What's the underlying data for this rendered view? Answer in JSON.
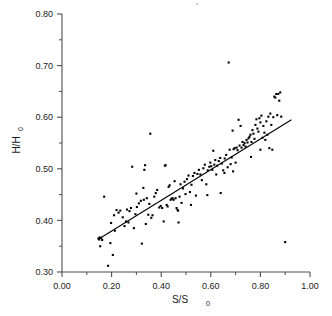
{
  "chart_data": {
    "type": "scatter",
    "title": "",
    "xlabel": "S/S0",
    "xlabel_base": "S/S",
    "xlabel_sub": "0",
    "ylabel": "H/H0",
    "ylabel_base": "H/H",
    "ylabel_sub": "0",
    "xlim": [
      0.0,
      1.0
    ],
    "ylim": [
      0.3,
      0.8
    ],
    "xticks": [
      0.0,
      0.2,
      0.4,
      0.6,
      0.8,
      1.0
    ],
    "xtick_labels": [
      "0.00",
      "0.20",
      "0.40",
      "0.60",
      "0.80",
      "1.00"
    ],
    "xticks_minor": [
      0.1,
      0.3,
      0.5,
      0.7,
      0.9
    ],
    "yticks": [
      0.3,
      0.4,
      0.5,
      0.6,
      0.7,
      0.8
    ],
    "ytick_labels": [
      "0.30",
      "0.40",
      "0.50",
      "0.60",
      "0.70",
      "0.80"
    ],
    "yticks_minor": [
      0.35,
      0.45,
      0.55,
      0.65,
      0.75
    ],
    "grid": false,
    "legend": null,
    "marker": "square",
    "marker_size_px": 2.1,
    "marker_color": "#000000",
    "series": [
      {
        "name": "observations",
        "points": [
          [
            0.147,
            0.365
          ],
          [
            0.15,
            0.363
          ],
          [
            0.152,
            0.367
          ],
          [
            0.154,
            0.35
          ],
          [
            0.158,
            0.366
          ],
          [
            0.162,
            0.362
          ],
          [
            0.17,
            0.446
          ],
          [
            0.186,
            0.312
          ],
          [
            0.195,
            0.356
          ],
          [
            0.198,
            0.395
          ],
          [
            0.205,
            0.333
          ],
          [
            0.21,
            0.41
          ],
          [
            0.213,
            0.38
          ],
          [
            0.22,
            0.42
          ],
          [
            0.228,
            0.415
          ],
          [
            0.235,
            0.419
          ],
          [
            0.245,
            0.406
          ],
          [
            0.252,
            0.389
          ],
          [
            0.258,
            0.398
          ],
          [
            0.262,
            0.421
          ],
          [
            0.268,
            0.396
          ],
          [
            0.272,
            0.418
          ],
          [
            0.278,
            0.424
          ],
          [
            0.283,
            0.504
          ],
          [
            0.29,
            0.385
          ],
          [
            0.296,
            0.412
          ],
          [
            0.302,
            0.426
          ],
          [
            0.31,
            0.433
          ],
          [
            0.318,
            0.438
          ],
          [
            0.322,
            0.355
          ],
          [
            0.328,
            0.463
          ],
          [
            0.332,
            0.498
          ],
          [
            0.335,
            0.507
          ],
          [
            0.338,
            0.393
          ],
          [
            0.342,
            0.443
          ],
          [
            0.348,
            0.411
          ],
          [
            0.352,
            0.432
          ],
          [
            0.356,
            0.568
          ],
          [
            0.36,
            0.405
          ],
          [
            0.365,
            0.41
          ],
          [
            0.372,
            0.446
          ],
          [
            0.378,
            0.453
          ],
          [
            0.384,
            0.459
          ],
          [
            0.392,
            0.425
          ],
          [
            0.398,
            0.428
          ],
          [
            0.404,
            0.424
          ],
          [
            0.41,
            0.398
          ],
          [
            0.415,
            0.506
          ],
          [
            0.418,
            0.507
          ],
          [
            0.422,
            0.43
          ],
          [
            0.426,
            0.427
          ],
          [
            0.43,
            0.465
          ],
          [
            0.434,
            0.468
          ],
          [
            0.438,
            0.44
          ],
          [
            0.442,
            0.442
          ],
          [
            0.446,
            0.443
          ],
          [
            0.45,
            0.44
          ],
          [
            0.454,
            0.476
          ],
          [
            0.458,
            0.443
          ],
          [
            0.462,
            0.424
          ],
          [
            0.466,
            0.42
          ],
          [
            0.47,
            0.396
          ],
          [
            0.474,
            0.446
          ],
          [
            0.478,
            0.47
          ],
          [
            0.482,
            0.434
          ],
          [
            0.488,
            0.462
          ],
          [
            0.494,
            0.475
          ],
          [
            0.498,
            0.451
          ],
          [
            0.504,
            0.48
          ],
          [
            0.51,
            0.487
          ],
          [
            0.516,
            0.455
          ],
          [
            0.522,
            0.469
          ],
          [
            0.528,
            0.486
          ],
          [
            0.534,
            0.492
          ],
          [
            0.54,
            0.448
          ],
          [
            0.546,
            0.49
          ],
          [
            0.552,
            0.498
          ],
          [
            0.558,
            0.489
          ],
          [
            0.564,
            0.478
          ],
          [
            0.57,
            0.501
          ],
          [
            0.576,
            0.508
          ],
          [
            0.582,
            0.47
          ],
          [
            0.588,
            0.497
          ],
          [
            0.594,
            0.504
          ],
          [
            0.598,
            0.512
          ],
          [
            0.602,
            0.505
          ],
          [
            0.606,
            0.498
          ],
          [
            0.61,
            0.535
          ],
          [
            0.614,
            0.508
          ],
          [
            0.618,
            0.517
          ],
          [
            0.622,
            0.489
          ],
          [
            0.626,
            0.506
          ],
          [
            0.632,
            0.515
          ],
          [
            0.638,
            0.521
          ],
          [
            0.644,
            0.51
          ],
          [
            0.65,
            0.497
          ],
          [
            0.656,
            0.52
          ],
          [
            0.662,
            0.527
          ],
          [
            0.668,
            0.503
          ],
          [
            0.672,
            0.706
          ],
          [
            0.676,
            0.537
          ],
          [
            0.68,
            0.509
          ],
          [
            0.684,
            0.522
          ],
          [
            0.688,
            0.574
          ],
          [
            0.692,
            0.538
          ],
          [
            0.696,
            0.54
          ],
          [
            0.7,
            0.512
          ],
          [
            0.704,
            0.541
          ],
          [
            0.708,
            0.536
          ],
          [
            0.712,
            0.595
          ],
          [
            0.716,
            0.545
          ],
          [
            0.72,
            0.583
          ],
          [
            0.724,
            0.541
          ],
          [
            0.728,
            0.552
          ],
          [
            0.732,
            0.546
          ],
          [
            0.736,
            0.55
          ],
          [
            0.74,
            0.543
          ],
          [
            0.744,
            0.556
          ],
          [
            0.748,
            0.551
          ],
          [
            0.752,
            0.559
          ],
          [
            0.756,
            0.562
          ],
          [
            0.76,
            0.566
          ],
          [
            0.764,
            0.552
          ],
          [
            0.768,
            0.575
          ],
          [
            0.772,
            0.568
          ],
          [
            0.776,
            0.558
          ],
          [
            0.78,
            0.585
          ],
          [
            0.784,
            0.596
          ],
          [
            0.788,
            0.578
          ],
          [
            0.792,
            0.572
          ],
          [
            0.796,
            0.598
          ],
          [
            0.8,
            0.59
          ],
          [
            0.804,
            0.603
          ],
          [
            0.808,
            0.56
          ],
          [
            0.812,
            0.583
          ],
          [
            0.816,
            0.57
          ],
          [
            0.82,
            0.556
          ],
          [
            0.824,
            0.592
          ],
          [
            0.828,
            0.566
          ],
          [
            0.832,
            0.601
          ],
          [
            0.836,
            0.54
          ],
          [
            0.84,
            0.607
          ],
          [
            0.844,
            0.585
          ],
          [
            0.848,
            0.537
          ],
          [
            0.852,
            0.6
          ],
          [
            0.856,
            0.64
          ],
          [
            0.86,
            0.638
          ],
          [
            0.864,
            0.645
          ],
          [
            0.868,
            0.604
          ],
          [
            0.872,
            0.645
          ],
          [
            0.876,
            0.632
          ],
          [
            0.88,
            0.648
          ],
          [
            0.884,
            0.601
          ],
          [
            0.9,
            0.358
          ],
          [
            0.64,
            0.453
          ],
          [
            0.586,
            0.449
          ],
          [
            0.52,
            0.43
          ],
          [
            0.468,
            0.419
          ],
          [
            0.33,
            0.44
          ],
          [
            0.3,
            0.452
          ],
          [
            0.762,
            0.523
          ],
          [
            0.8,
            0.537
          ],
          [
            0.69,
            0.495
          ],
          [
            0.655,
            0.492
          ]
        ]
      }
    ],
    "fit_line": {
      "name": "linear-regression",
      "x_start": 0.145,
      "y_start": 0.363,
      "x_end": 0.925,
      "y_end": 0.595,
      "color": "#000000"
    }
  }
}
